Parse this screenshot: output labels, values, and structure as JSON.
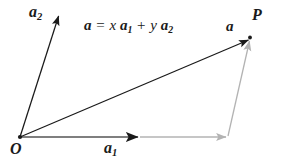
{
  "figure": {
    "title_equation": {
      "lhs": "a",
      "equals": "=",
      "term1_scalar": "x",
      "term1_vector": "a",
      "term1_sub": "1",
      "plus": "+",
      "term2_scalar": "y",
      "term2_vector": "a",
      "term2_sub": "2"
    },
    "labels": {
      "origin": "O",
      "point": "P",
      "basis1": "a",
      "basis1_sub": "1",
      "basis2": "a",
      "basis2_sub": "2",
      "resultant": "a"
    },
    "colors": {
      "background": "#ffffff",
      "ink": "#1a1a1a",
      "basis1_shaft": "#555555",
      "ghost_gray": "#b3b3b3"
    },
    "geometry": {
      "origin": [
        20,
        137
      ],
      "point_p": [
        250,
        38
      ],
      "basis1_tip": [
        140,
        137
      ],
      "basis1_extended_tip": [
        228,
        137
      ],
      "basis2_tip": [
        60,
        12
      ]
    }
  }
}
